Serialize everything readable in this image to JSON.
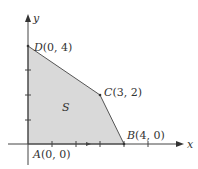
{
  "diagram": {
    "title": "",
    "region": {
      "name": "S",
      "fill": "#d9d9d9",
      "stroke": "#555555"
    },
    "axes": {
      "x_label": "x",
      "y_label": "y",
      "color": "#444444"
    },
    "vertices": [
      {
        "id": "A",
        "label": "A(0, 0)",
        "letter": "A",
        "coords": "(0, 0)",
        "x": 0,
        "y": 0
      },
      {
        "id": "B",
        "label": "B(4, 0)",
        "letter": "B",
        "coords": "(4, 0)",
        "x": 4,
        "y": 0
      },
      {
        "id": "C",
        "label": "C(3, 2)",
        "letter": "C",
        "coords": "(3, 2)",
        "x": 3,
        "y": 2
      },
      {
        "id": "D",
        "label": "D(0, 4)",
        "letter": "D",
        "coords": "(0, 4)",
        "x": 0,
        "y": 4
      }
    ]
  }
}
